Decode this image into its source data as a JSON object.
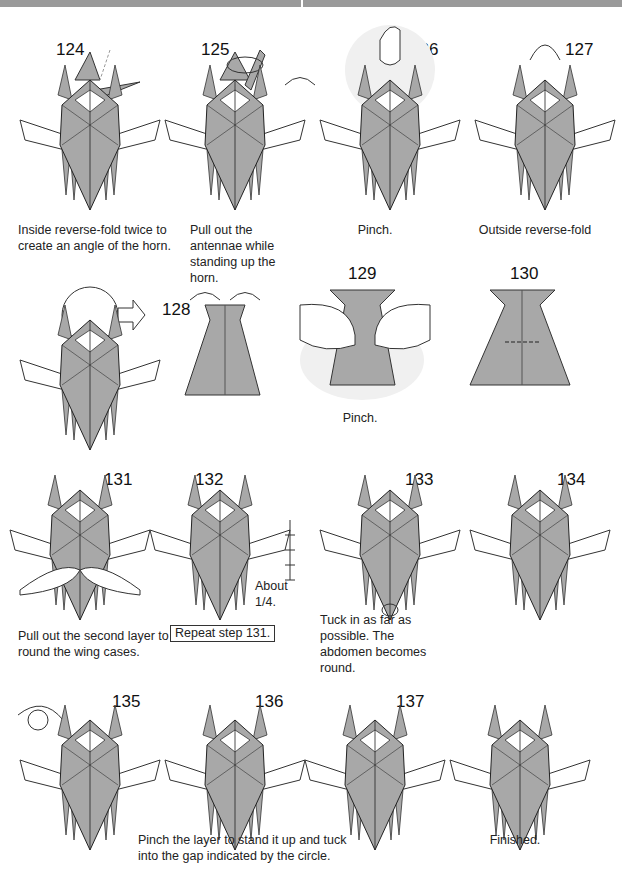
{
  "page": {
    "colors": {
      "paper": "#a8a8a8",
      "paper_dark": "#8c8c8c",
      "line": "#222222",
      "header_bar": "#9a9a9a"
    }
  },
  "steps": [
    {
      "number": "124",
      "caption": "Inside reverse-fold twice to create an angle of the horn."
    },
    {
      "number": "125",
      "caption": "Pull out the antennae while standing up the horn."
    },
    {
      "number": "126",
      "caption": "Pinch."
    },
    {
      "number": "127",
      "caption": "Outside reverse-fold"
    },
    {
      "number": "128",
      "caption": ""
    },
    {
      "number": "129",
      "caption": "Pinch."
    },
    {
      "number": "130",
      "caption": ""
    },
    {
      "number": "131",
      "caption": "Pull out the second layer to round the wing cases."
    },
    {
      "number": "132",
      "caption": "",
      "note": "About 1/4.",
      "repeat_label": "Repeat step 131."
    },
    {
      "number": "133",
      "caption": "Tuck in as far as possible. The abdomen becomes round."
    },
    {
      "number": "134",
      "caption": ""
    },
    {
      "number": "135",
      "caption": ""
    },
    {
      "number": "136",
      "caption": "Pinch the layer to stand it up and tuck into the gap indicated by the circle."
    },
    {
      "number": "137",
      "caption": ""
    },
    {
      "number": "",
      "caption": "Finished."
    }
  ]
}
